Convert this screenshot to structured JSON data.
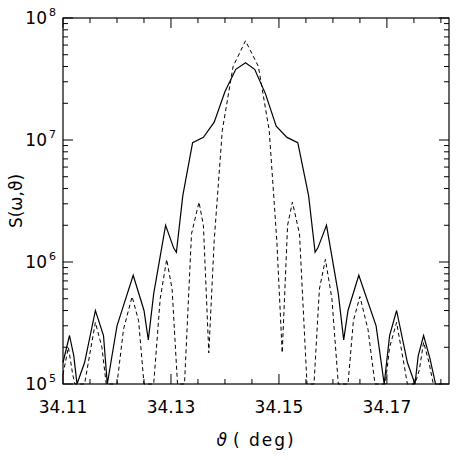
{
  "chart_data": {
    "type": "line",
    "title": "",
    "xlabel": "ϑ (deg)",
    "ylabel": "S(ω,ϑ)",
    "xlim": [
      34.11,
      34.1815
    ],
    "ylim": [
      100000,
      100000000
    ],
    "yscale": "log",
    "x_ticks": [
      34.11,
      34.13,
      34.15,
      34.17
    ],
    "x_tick_labels": [
      "34.11",
      "34.13",
      "34.15",
      "34.17"
    ],
    "y_ticks": [
      100000,
      1000000,
      10000000,
      100000000
    ],
    "y_tick_labels": [
      {
        "base": "10",
        "exp": "5"
      },
      {
        "base": "10",
        "exp": "6"
      },
      {
        "base": "10",
        "exp": "7"
      },
      {
        "base": "10",
        "exp": "8"
      }
    ],
    "grid": false,
    "legend": null,
    "series": [
      {
        "name": "solid",
        "style": "solid",
        "color": "#000000",
        "points": [
          [
            34.11,
            150000
          ],
          [
            34.1112,
            250000
          ],
          [
            34.112,
            170000
          ],
          [
            34.1126,
            100000
          ],
          [
            34.114,
            150000
          ],
          [
            34.116,
            400000
          ],
          [
            34.1175,
            250000
          ],
          [
            34.1182,
            100000
          ],
          [
            34.12,
            300000
          ],
          [
            34.123,
            780000
          ],
          [
            34.125,
            400000
          ],
          [
            34.1258,
            230000
          ],
          [
            34.1268,
            550000
          ],
          [
            34.129,
            2000000
          ],
          [
            34.1305,
            1300000
          ],
          [
            34.131,
            1200000
          ],
          [
            34.1322,
            3500000
          ],
          [
            34.134,
            9500000
          ],
          [
            34.136,
            10500000
          ],
          [
            34.138,
            14000000
          ],
          [
            34.14,
            25000000
          ],
          [
            34.142,
            38000000
          ],
          [
            34.1438,
            43000000
          ],
          [
            34.1455,
            38000000
          ],
          [
            34.1475,
            24000000
          ],
          [
            34.1495,
            13000000
          ],
          [
            34.1515,
            10500000
          ],
          [
            34.1535,
            9500000
          ],
          [
            34.1555,
            3500000
          ],
          [
            34.1567,
            1200000
          ],
          [
            34.1572,
            1300000
          ],
          [
            34.1588,
            2000000
          ],
          [
            34.161,
            550000
          ],
          [
            34.162,
            230000
          ],
          [
            34.1628,
            400000
          ],
          [
            34.1648,
            780000
          ],
          [
            34.168,
            300000
          ],
          [
            34.1695,
            100000
          ],
          [
            34.1705,
            250000
          ],
          [
            34.1718,
            400000
          ],
          [
            34.1738,
            150000
          ],
          [
            34.1752,
            100000
          ],
          [
            34.1758,
            170000
          ],
          [
            34.1768,
            250000
          ],
          [
            34.178,
            160000
          ],
          [
            34.179,
            100000
          ],
          [
            34.18,
            100000
          ]
        ]
      },
      {
        "name": "dashed",
        "style": "dashed",
        "color": "#000000",
        "points": [
          [
            34.11,
            120000
          ],
          [
            34.111,
            200000
          ],
          [
            34.1118,
            120000
          ],
          [
            34.1122,
            100000
          ],
          [
            34.114,
            100000
          ],
          [
            34.115,
            180000
          ],
          [
            34.116,
            320000
          ],
          [
            34.1172,
            200000
          ],
          [
            34.118,
            100000
          ],
          [
            34.12,
            100000
          ],
          [
            34.1212,
            280000
          ],
          [
            34.1228,
            520000
          ],
          [
            34.124,
            330000
          ],
          [
            34.125,
            100000
          ],
          [
            34.1268,
            100000
          ],
          [
            34.128,
            500000
          ],
          [
            34.1292,
            1050000
          ],
          [
            34.1302,
            600000
          ],
          [
            34.1312,
            100000
          ],
          [
            34.1325,
            100000
          ],
          [
            34.1338,
            1700000
          ],
          [
            34.1352,
            3100000
          ],
          [
            34.136,
            2000000
          ],
          [
            34.137,
            180000
          ],
          [
            34.138,
            1500000
          ],
          [
            34.1395,
            12000000
          ],
          [
            34.1415,
            40000000
          ],
          [
            34.1438,
            65000000
          ],
          [
            34.1462,
            40000000
          ],
          [
            34.1482,
            12000000
          ],
          [
            34.1496,
            1500000
          ],
          [
            34.1506,
            180000
          ],
          [
            34.1516,
            2000000
          ],
          [
            34.1525,
            3100000
          ],
          [
            34.1538,
            1700000
          ],
          [
            34.1552,
            100000
          ],
          [
            34.1565,
            100000
          ],
          [
            34.1575,
            600000
          ],
          [
            34.1586,
            1050000
          ],
          [
            34.1598,
            500000
          ],
          [
            34.161,
            100000
          ],
          [
            34.1628,
            100000
          ],
          [
            34.1638,
            330000
          ],
          [
            34.165,
            520000
          ],
          [
            34.1665,
            280000
          ],
          [
            34.1678,
            100000
          ],
          [
            34.1697,
            100000
          ],
          [
            34.1705,
            200000
          ],
          [
            34.1718,
            320000
          ],
          [
            34.1728,
            180000
          ],
          [
            34.1738,
            100000
          ],
          [
            34.1752,
            100000
          ],
          [
            34.176,
            130000
          ],
          [
            34.1768,
            220000
          ],
          [
            34.1778,
            150000
          ],
          [
            34.1786,
            100000
          ]
        ]
      }
    ]
  },
  "axes": {
    "x_label_theta": "ϑ",
    "x_label_unit": "( deg)",
    "y_label": "S(ω,ϑ)"
  }
}
